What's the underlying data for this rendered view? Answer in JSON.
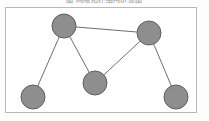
{
  "figure": {
    "caption": "图  网络拓扑结构示意图",
    "frame": {
      "x": 5,
      "y": 7,
      "width": 192,
      "height": 106,
      "border_color": "#b9b9b9",
      "background": "#ffffff"
    }
  },
  "graph_data": {
    "type": "node-link-diagram",
    "directed": false,
    "node_style": {
      "fill": "#8e8e8e",
      "stroke": "#5f5f5f",
      "stroke_width": 1,
      "radius": 12,
      "shape": "circle"
    },
    "edge_style": {
      "stroke": "#6e6e6e",
      "stroke_width": 1
    },
    "nodes": [
      {
        "id": "n1",
        "label": "",
        "x": 64,
        "y": 26,
        "r": 12,
        "position_name": "top-left"
      },
      {
        "id": "n2",
        "label": "",
        "x": 149,
        "y": 33,
        "r": 12,
        "position_name": "top-right"
      },
      {
        "id": "n3",
        "label": "",
        "x": 95,
        "y": 83,
        "r": 12,
        "position_name": "center-bottom"
      },
      {
        "id": "n4",
        "label": "",
        "x": 33,
        "y": 97,
        "r": 12,
        "position_name": "bottom-left"
      },
      {
        "id": "n5",
        "label": "",
        "x": 176,
        "y": 97,
        "r": 12,
        "position_name": "bottom-right"
      }
    ],
    "edges": [
      {
        "source": "n1",
        "target": "n2"
      },
      {
        "source": "n1",
        "target": "n3"
      },
      {
        "source": "n1",
        "target": "n4"
      },
      {
        "source": "n2",
        "target": "n3"
      },
      {
        "source": "n2",
        "target": "n5"
      }
    ],
    "node_count": 5,
    "edge_count": 5
  }
}
